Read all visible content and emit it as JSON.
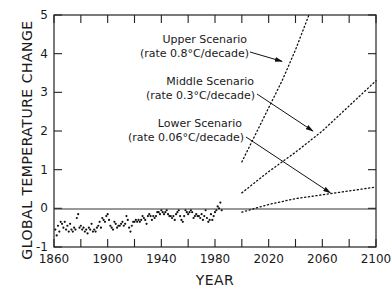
{
  "chart_data": {
    "type": "line",
    "title": "",
    "xlabel": "YEAR",
    "ylabel": "GLOBAL TEMPERATURE CHANGE",
    "xlim": [
      1860,
      2100
    ],
    "ylim": [
      -1,
      5
    ],
    "x_ticks": [
      1860,
      1900,
      1940,
      1980,
      2020,
      2060,
      2100
    ],
    "x_minor_ticks": [
      1880,
      1920,
      1960,
      2000,
      2040,
      2080
    ],
    "y_ticks": [
      -1,
      0,
      1,
      2,
      3,
      4,
      5
    ],
    "grid": false,
    "reference_line": {
      "y": 0
    },
    "series": [
      {
        "name": "Observed",
        "style": "scatter",
        "x": [
          1861,
          1862,
          1863,
          1864,
          1865,
          1866,
          1867,
          1868,
          1869,
          1870,
          1871,
          1872,
          1873,
          1874,
          1875,
          1876,
          1877,
          1878,
          1879,
          1880,
          1881,
          1882,
          1883,
          1884,
          1885,
          1886,
          1887,
          1888,
          1889,
          1890,
          1891,
          1892,
          1893,
          1894,
          1895,
          1896,
          1897,
          1898,
          1899,
          1900,
          1901,
          1902,
          1903,
          1904,
          1905,
          1906,
          1907,
          1908,
          1909,
          1910,
          1911,
          1912,
          1913,
          1914,
          1915,
          1916,
          1917,
          1918,
          1919,
          1920,
          1921,
          1922,
          1923,
          1924,
          1925,
          1926,
          1927,
          1928,
          1929,
          1930,
          1931,
          1932,
          1933,
          1934,
          1935,
          1936,
          1937,
          1938,
          1939,
          1940,
          1941,
          1942,
          1943,
          1944,
          1945,
          1946,
          1947,
          1948,
          1949,
          1950,
          1951,
          1952,
          1953,
          1954,
          1955,
          1956,
          1957,
          1958,
          1959,
          1960,
          1961,
          1962,
          1963,
          1964,
          1965,
          1966,
          1967,
          1968,
          1969,
          1970,
          1971,
          1972,
          1973,
          1974,
          1975,
          1976,
          1977,
          1978,
          1979,
          1980,
          1981,
          1982,
          1983,
          1984,
          1985
        ],
        "y": [
          -0.55,
          -0.7,
          -0.45,
          -0.6,
          -0.35,
          -0.4,
          -0.5,
          -0.35,
          -0.55,
          -0.45,
          -0.6,
          -0.4,
          -0.55,
          -0.6,
          -0.5,
          -0.55,
          -0.25,
          -0.15,
          -0.5,
          -0.45,
          -0.55,
          -0.5,
          -0.6,
          -0.55,
          -0.65,
          -0.5,
          -0.55,
          -0.4,
          -0.6,
          -0.55,
          -0.6,
          -0.5,
          -0.45,
          -0.35,
          -0.5,
          -0.25,
          -0.3,
          -0.35,
          -0.2,
          -0.15,
          -0.3,
          -0.45,
          -0.5,
          -0.55,
          -0.35,
          -0.4,
          -0.5,
          -0.45,
          -0.45,
          -0.4,
          -0.35,
          -0.45,
          -0.4,
          -0.2,
          -0.3,
          -0.5,
          -0.6,
          -0.45,
          -0.35,
          -0.35,
          -0.3,
          -0.35,
          -0.3,
          -0.35,
          -0.3,
          -0.2,
          -0.25,
          -0.3,
          -0.4,
          -0.2,
          -0.15,
          -0.2,
          -0.3,
          -0.2,
          -0.25,
          -0.2,
          -0.1,
          -0.1,
          -0.15,
          -0.05,
          -0.1,
          -0.15,
          -0.1,
          -0.05,
          -0.15,
          -0.2,
          -0.2,
          -0.25,
          -0.2,
          -0.3,
          -0.15,
          -0.1,
          -0.05,
          -0.2,
          -0.3,
          -0.35,
          -0.2,
          -0.05,
          -0.1,
          -0.15,
          -0.1,
          -0.05,
          -0.1,
          -0.25,
          -0.2,
          -0.15,
          -0.2,
          -0.2,
          -0.25,
          -0.15,
          -0.3,
          -0.2,
          -0.05,
          -0.25,
          -0.35,
          -0.3,
          -0.15,
          -0.3,
          -0.2,
          -0.1,
          -0.05,
          0.05,
          0.0,
          0.15,
          -0.05
        ]
      },
      {
        "name": "Upper Scenario",
        "style": "dotted",
        "rate": "0.8°C/decade",
        "x": [
          2000,
          2010,
          2020,
          2030,
          2040,
          2050
        ],
        "y": [
          1.2,
          1.9,
          2.6,
          3.3,
          4.1,
          5.0
        ]
      },
      {
        "name": "Middle Scenario",
        "style": "dotted",
        "rate": "0.3°C/decade",
        "x": [
          2000,
          2020,
          2040,
          2060,
          2080,
          2100
        ],
        "y": [
          0.4,
          0.95,
          1.45,
          2.0,
          2.65,
          3.3
        ]
      },
      {
        "name": "Lower Scenario",
        "style": "dotted",
        "rate": "0.06°C/decade",
        "x": [
          2000,
          2020,
          2040,
          2060,
          2080,
          2100
        ],
        "y": [
          -0.1,
          0.1,
          0.25,
          0.35,
          0.45,
          0.55
        ]
      }
    ],
    "annotations": [
      {
        "line1": "Upper Scenario",
        "line2": "(rate 0.8°C/decade)",
        "arrow_to": [
          2030,
          3.8
        ]
      },
      {
        "line1": "Middle Scenario",
        "line2": "(rate 0.3°C/decade)",
        "arrow_to": [
          2053,
          2.0
        ]
      },
      {
        "line1": "Lower Scenario",
        "line2": "(rate 0.06°C/decade)",
        "arrow_to": [
          2066,
          0.4
        ]
      }
    ]
  },
  "labels": {
    "xlabel": "YEAR",
    "ylabel": "GLOBAL TEMPERATURE CHANGE",
    "x_ticks": [
      "1860",
      "1900",
      "1940",
      "1980",
      "2020",
      "2060",
      "2100"
    ],
    "y_ticks": [
      "-1",
      "0",
      "1",
      "2",
      "3",
      "4",
      "5"
    ],
    "upper_l1": "Upper Scenario",
    "upper_l2": "(rate 0.8°C/decade)",
    "middle_l1": "Middle Scenario",
    "middle_l2": "(rate 0.3°C/decade)",
    "lower_l1": "Lower Scenario",
    "lower_l2": "(rate 0.06°C/decade)"
  }
}
